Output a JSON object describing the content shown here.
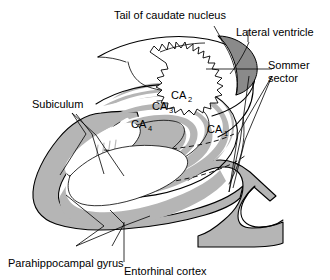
{
  "figure": {
    "width": 330,
    "height": 280,
    "background_color": "#ffffff"
  },
  "colors": {
    "cortex_gray": "#b5b5b5",
    "ventricle_gray": "#8a8a8a",
    "white_matter": "#ffffff",
    "outline": "#000000",
    "hatch": "#b9b9b9"
  },
  "labels": {
    "tail_of_caudate_nucleus": "Tail of caudate nucleus",
    "lateral_ventricle": "Lateral ventricle",
    "sommer_sector_line1": "Sommer",
    "sommer_sector_line2": "sector",
    "subiculum": "Subiculum",
    "parahippocampal_gyrus": "Parahippocampal gyrus",
    "entorhinal_cortex": "Entorhinal cortex"
  },
  "regions": {
    "ca1_base": "CA",
    "ca1_sub": "1",
    "ca2_base": "CA",
    "ca2_sub": "2",
    "ca3_base": "CA",
    "ca3_sub": "3",
    "ca4_base": "CA",
    "ca4_sub": "4"
  }
}
